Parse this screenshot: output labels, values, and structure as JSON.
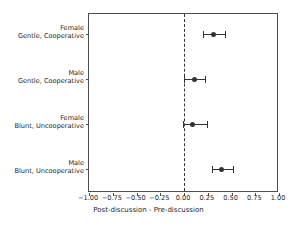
{
  "chart_data": {
    "type": "scatter",
    "subtype": "forest-plot-with-error-bars",
    "title": "",
    "xlabel": "Post-discussion - Pre-discussion",
    "ylabel": "",
    "xlim": [
      -1.0,
      1.0
    ],
    "xticks": [
      -1.0,
      -0.75,
      -0.5,
      -0.25,
      0.0,
      0.25,
      0.5,
      0.75,
      1.0
    ],
    "xticklabels": [
      "−1.00",
      "−0.75",
      "−0.50",
      "−0.25",
      "0.00",
      "0.25",
      "0.50",
      "0.75",
      "1.00"
    ],
    "grid": false,
    "legend": false,
    "reference_line": {
      "x": 0.0,
      "style": "dashed",
      "color": "#333333"
    },
    "marker_color": "#333333",
    "categories": [
      {
        "line1": "Female",
        "line2": "Gentle, Cooperative"
      },
      {
        "line1": "Male",
        "line2": "Gentle, Cooperative"
      },
      {
        "line1": "Female",
        "line2": "Blunt, Uncooperative"
      },
      {
        "line1": "Male",
        "line2": "Blunt, Uncooperative"
      }
    ],
    "points": [
      {
        "label": "Female Gentle, Cooperative",
        "value": 0.31,
        "ci_low": 0.2,
        "ci_high": 0.43
      },
      {
        "label": "Male Gentle, Cooperative",
        "value": 0.11,
        "ci_low": 0.0,
        "ci_high": 0.22
      },
      {
        "label": "Female Blunt, Uncooperative",
        "value": 0.09,
        "ci_low": -0.01,
        "ci_high": 0.24
      },
      {
        "label": "Male Blunt, Uncooperative",
        "value": 0.39,
        "ci_low": 0.29,
        "ci_high": 0.52
      }
    ]
  }
}
